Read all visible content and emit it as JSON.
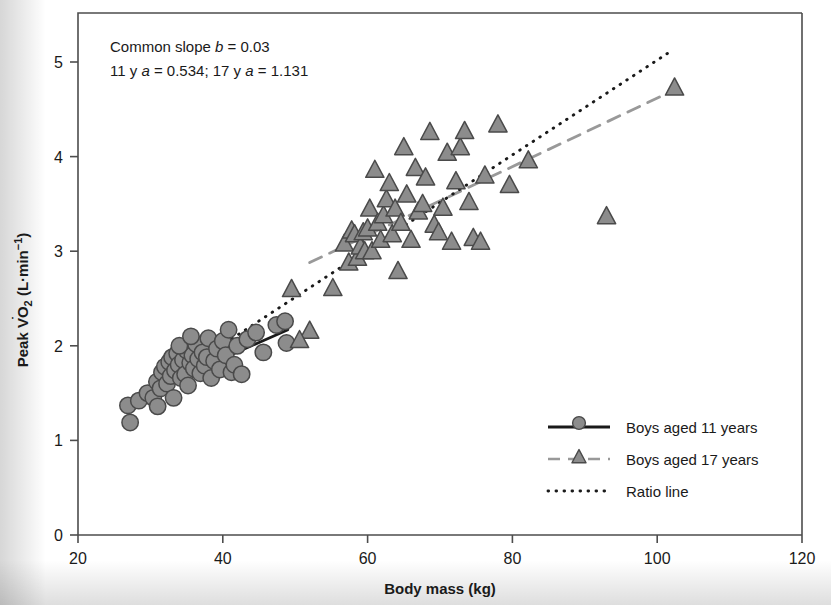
{
  "chart_data": {
    "type": "scatter",
    "title": "",
    "xlabel": "Body mass (kg)",
    "ylabel": "Peak VO2 (L·min−1)",
    "ylabel_parts": {
      "prefix": "Peak ",
      "v": "V",
      "dot": "˙",
      "o": "O",
      "sub": "2",
      "units_open": " (L·min",
      "sup": "−1",
      "units_close": ")"
    },
    "xlim": [
      20,
      120
    ],
    "ylim": [
      0,
      5.4
    ],
    "xticks": [
      20,
      40,
      60,
      80,
      100,
      120
    ],
    "yticks": [
      0,
      1,
      2,
      3,
      4,
      5
    ],
    "grid": false,
    "legend_position": "bottom-right",
    "annotations": [
      "Common slope b = 0.03",
      "11 y a = 0.534; 17 y a = 1.131"
    ],
    "annotation_parts": [
      {
        "pre": "Common slope ",
        "ital": "b",
        "post": " = 0.03"
      },
      {
        "pre": "11 y ",
        "ital": "a",
        "mid": " = 0.534; 17 y ",
        "ital2": "a",
        "post": " = 1.131"
      }
    ],
    "series": [
      {
        "name": "Boys aged 11 years",
        "marker": "circle",
        "marker_fill": "#8c8c8c",
        "marker_edge": "#4a4a4a",
        "line_style": "solid",
        "line_color": "#1a1a1a",
        "points": [
          [
            26.9,
            1.37
          ],
          [
            27.2,
            1.19
          ],
          [
            28.4,
            1.42
          ],
          [
            29.6,
            1.5
          ],
          [
            30.4,
            1.45
          ],
          [
            30.9,
            1.62
          ],
          [
            31.4,
            1.55
          ],
          [
            31.6,
            1.72
          ],
          [
            32.0,
            1.78
          ],
          [
            32.3,
            1.6
          ],
          [
            32.6,
            1.83
          ],
          [
            32.8,
            1.68
          ],
          [
            33.0,
            1.88
          ],
          [
            33.2,
            1.45
          ],
          [
            33.4,
            1.74
          ],
          [
            33.7,
            1.92
          ],
          [
            33.9,
            1.8
          ],
          [
            34.2,
            1.66
          ],
          [
            34.5,
            1.85
          ],
          [
            34.8,
            1.7
          ],
          [
            35.0,
            1.95
          ],
          [
            35.2,
            1.58
          ],
          [
            35.5,
            1.82
          ],
          [
            35.8,
            1.9
          ],
          [
            36.0,
            1.76
          ],
          [
            36.3,
            2.02
          ],
          [
            36.6,
            1.86
          ],
          [
            36.9,
            1.71
          ],
          [
            37.2,
            1.93
          ],
          [
            37.5,
            1.79
          ],
          [
            37.8,
            1.88
          ],
          [
            38.0,
            2.08
          ],
          [
            38.4,
            1.66
          ],
          [
            38.8,
            1.84
          ],
          [
            39.2,
            1.97
          ],
          [
            39.6,
            1.75
          ],
          [
            40.0,
            2.05
          ],
          [
            40.4,
            1.9
          ],
          [
            40.8,
            2.17
          ],
          [
            41.2,
            1.72
          ],
          [
            41.6,
            1.8
          ],
          [
            42.0,
            2.0
          ],
          [
            42.6,
            1.7
          ],
          [
            43.4,
            2.07
          ],
          [
            44.6,
            2.14
          ],
          [
            45.6,
            1.93
          ],
          [
            47.4,
            2.22
          ],
          [
            48.6,
            2.26
          ],
          [
            48.8,
            2.03
          ],
          [
            34.0,
            2.0
          ],
          [
            35.6,
            2.1
          ],
          [
            31.0,
            1.36
          ]
        ],
        "fit_line": {
          "x0": 27.5,
          "y0": 1.44,
          "x1": 49.0,
          "y1": 2.17
        }
      },
      {
        "name": "Boys aged 17 years",
        "marker": "triangle",
        "marker_fill": "#8c8c8c",
        "marker_edge": "#4a4a4a",
        "line_style": "dashed",
        "line_color": "#999999",
        "points": [
          [
            49.5,
            2.6
          ],
          [
            52.0,
            2.16
          ],
          [
            55.2,
            2.61
          ],
          [
            56.8,
            3.08
          ],
          [
            57.4,
            2.88
          ],
          [
            57.8,
            3.22
          ],
          [
            58.2,
            3.18
          ],
          [
            58.6,
            2.93
          ],
          [
            59.0,
            3.05
          ],
          [
            59.4,
            3.2
          ],
          [
            59.6,
            3.0
          ],
          [
            60.0,
            3.24
          ],
          [
            60.3,
            3.45
          ],
          [
            60.6,
            3.0
          ],
          [
            61.0,
            3.86
          ],
          [
            61.4,
            3.3
          ],
          [
            61.8,
            3.12
          ],
          [
            62.2,
            3.38
          ],
          [
            62.6,
            3.55
          ],
          [
            63.0,
            3.72
          ],
          [
            63.4,
            3.18
          ],
          [
            63.8,
            3.45
          ],
          [
            64.2,
            2.79
          ],
          [
            64.6,
            3.3
          ],
          [
            65.0,
            4.1
          ],
          [
            65.4,
            3.6
          ],
          [
            66.0,
            3.12
          ],
          [
            66.6,
            3.88
          ],
          [
            67.0,
            3.42
          ],
          [
            67.6,
            3.5
          ],
          [
            68.0,
            3.78
          ],
          [
            68.6,
            4.26
          ],
          [
            69.2,
            3.28
          ],
          [
            69.8,
            3.2
          ],
          [
            70.4,
            3.46
          ],
          [
            71.0,
            4.04
          ],
          [
            71.6,
            3.1
          ],
          [
            72.2,
            3.74
          ],
          [
            72.8,
            4.1
          ],
          [
            73.4,
            4.27
          ],
          [
            74.0,
            3.52
          ],
          [
            74.6,
            3.14
          ],
          [
            75.6,
            3.1
          ],
          [
            76.2,
            3.8
          ],
          [
            78.0,
            4.34
          ],
          [
            79.6,
            3.7
          ],
          [
            82.2,
            3.96
          ],
          [
            93.0,
            3.37
          ],
          [
            102.4,
            4.73
          ],
          [
            50.6,
            2.06
          ]
        ],
        "fit_line": {
          "x0": 52.0,
          "y0": 2.88,
          "x1": 102.8,
          "y1": 4.72
        }
      },
      {
        "name": "Ratio line",
        "marker": "none",
        "line_style": "dotted",
        "line_color": "#1a1a1a",
        "fit_line": {
          "x0": 27.4,
          "y0": 1.38,
          "x1": 102.0,
          "y1": 5.12
        }
      }
    ]
  },
  "legend": {
    "items": [
      {
        "label": "Boys aged 11 years",
        "style": "solid-circle"
      },
      {
        "label": "Boys aged 17 years",
        "style": "dashed-triangle"
      },
      {
        "label": "Ratio line",
        "style": "dotted"
      }
    ]
  }
}
